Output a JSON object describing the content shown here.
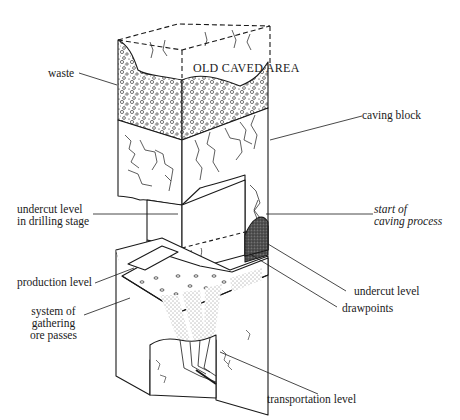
{
  "figure": {
    "labels": {
      "old_caved_area": "OLD CAVED AREA",
      "waste": "waste",
      "caving_block": "caving block",
      "undercut_drilling": "undercut level\nin drilling stage",
      "start_caving": "start of\ncaving process",
      "production_level": "production level",
      "system_ore_passes": "system of\ngathering\nore passes",
      "undercut_level": "undercut level",
      "drawpoints": "drawpoints",
      "transportation_level": "transportation level"
    },
    "colors": {
      "ink": "#1a1a1a",
      "paper": "#ffffff"
    }
  }
}
